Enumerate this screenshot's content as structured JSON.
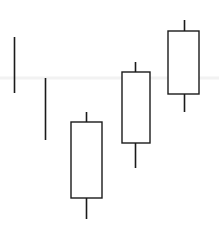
{
  "chart_data": {
    "type": "candlestick",
    "title": "",
    "subtitle": "",
    "xlabel": "",
    "ylabel": "",
    "grid": true,
    "legend": null,
    "background_color": "#ffffff",
    "line_color": "#1a1a1a",
    "body_fill_color": "#ffffff",
    "gridline_color": "#f2f2f2",
    "gridline_values": [
      0.0
    ],
    "axis_visible": false,
    "tick_labels_x": [],
    "tick_labels_y": [],
    "categories": [
      "1",
      "2",
      "3",
      "4",
      "5"
    ],
    "note": "Five-period candlestick sequence, all candles hollow/unfilled with dark outlines. Candles 1 and 2 are doji-style with no visible body.",
    "candles": [
      {
        "index": 1,
        "label": "1",
        "open": 0.72,
        "high": 0.72,
        "low": 0.46,
        "close": 0.72,
        "body": "none",
        "direction": "doji",
        "px": {
          "cx": 14.5,
          "high_y": 37,
          "low_y": 93,
          "body_top_y": 37,
          "body_bottom_y": 93,
          "body_left_x": 14,
          "body_right_x": 15
        }
      },
      {
        "index": 2,
        "label": "2",
        "open": 0.54,
        "high": 0.54,
        "low": 0.26,
        "close": 0.54,
        "body": "none",
        "direction": "doji",
        "px": {
          "cx": 45.5,
          "high_y": 78,
          "low_y": 140,
          "body_top_y": 78,
          "body_bottom_y": 140,
          "body_left_x": 45,
          "body_right_x": 46
        }
      },
      {
        "index": 3,
        "label": "3",
        "open": 0.33,
        "high": 0.38,
        "low": 0.03,
        "close": 0.1,
        "body": "hollow",
        "direction": "down",
        "px": {
          "cx": 86.5,
          "high_y": 112,
          "low_y": 219,
          "body_top_y": 122,
          "body_bottom_y": 198,
          "body_left_x": 71,
          "body_right_x": 102
        }
      },
      {
        "index": 4,
        "label": "4",
        "open": 0.6,
        "high": 0.65,
        "low": 0.26,
        "close": 0.27,
        "body": "hollow",
        "direction": "down",
        "px": {
          "cx": 135.5,
          "high_y": 62,
          "low_y": 168,
          "body_top_y": 72,
          "body_bottom_y": 143,
          "body_left_x": 122,
          "body_right_x": 150
        }
      },
      {
        "index": 5,
        "label": "5",
        "open": 0.79,
        "high": 0.84,
        "low": 0.5,
        "close": 0.51,
        "body": "hollow",
        "direction": "down",
        "px": {
          "cx": 184.5,
          "high_y": 20,
          "low_y": 112,
          "body_top_y": 31,
          "body_bottom_y": 94,
          "body_left_x": 168,
          "body_right_x": 199
        }
      }
    ],
    "gridlines_px": [
      {
        "y": 78
      }
    ]
  }
}
